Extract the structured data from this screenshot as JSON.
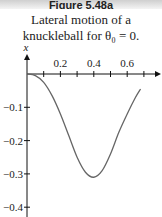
{
  "header": {
    "figure_label": "Figure 5.48a"
  },
  "caption": {
    "line1": "Lateral motion of a",
    "line2": "knuckleball for θ₀ = 0."
  },
  "chart_data": {
    "type": "line",
    "xlabel": "",
    "ylabel": "x",
    "xlim": [
      0,
      0.78
    ],
    "ylim": [
      -0.42,
      0
    ],
    "grid": false,
    "legend": null,
    "x_ticks": [
      0.1,
      0.2,
      0.3,
      0.4,
      0.5,
      0.6,
      0.7
    ],
    "x_tick_labels": [
      "0.2",
      "0.4",
      "0.6"
    ],
    "y_ticks": [
      -0.1,
      -0.2,
      -0.3,
      -0.4
    ],
    "y_tick_labels": [
      "−0.1",
      "−0.2",
      "−0.3",
      "−0.4"
    ],
    "series": [
      {
        "name": "lateral displacement",
        "color": "#666666",
        "x": [
          0.0,
          0.05,
          0.1,
          0.15,
          0.2,
          0.25,
          0.3,
          0.35,
          0.4,
          0.45,
          0.5,
          0.55,
          0.6,
          0.65,
          0.68
        ],
        "y": [
          0.0,
          -0.005,
          -0.025,
          -0.065,
          -0.12,
          -0.185,
          -0.25,
          -0.295,
          -0.31,
          -0.29,
          -0.24,
          -0.175,
          -0.12,
          -0.07,
          -0.045
        ]
      }
    ]
  }
}
